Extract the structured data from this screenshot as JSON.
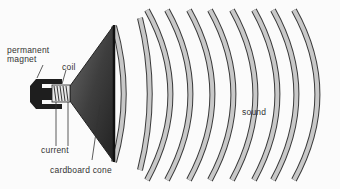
{
  "diagram": {
    "labels": {
      "magnet": "permanent\nmagnet",
      "magnet_line1": "permanent",
      "magnet_line2": "magnet",
      "coil": "coil",
      "current": "current",
      "cone": "cardboard cone",
      "sound": "sound"
    },
    "colors": {
      "background": "#fbfbfb",
      "magnet": "#1e1e1e",
      "cone": "#4a4a4a",
      "wave_fill": "#c8c8c8",
      "wave_edge": "#3a3a3a",
      "label": "#333333"
    },
    "waves": {
      "count": 10,
      "midline_x": [
        124,
        150,
        171,
        191,
        213,
        234,
        256,
        278,
        297,
        318
      ]
    }
  }
}
